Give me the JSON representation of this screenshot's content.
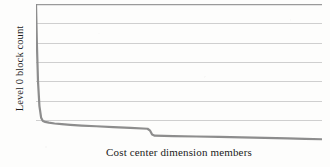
{
  "figure": {
    "background_color": "#fdfdfc",
    "plot_area": {
      "left": 36,
      "top": 4,
      "width": 286,
      "height": 138
    }
  },
  "chart_data": {
    "type": "line",
    "title": "",
    "subtitle": "",
    "xlabel": "Cost center dimension members",
    "ylabel": "Level 0 block count",
    "legend": [],
    "legend_position": "none",
    "grid": true,
    "grid_orientation": "horizontal",
    "grid_line_count": 7,
    "grid_color": "#c9c9c9",
    "top_border_color": "#9a9a9a",
    "line_color": "#8d8d8d",
    "line_width": 2.2,
    "xlim": [
      0,
      100
    ],
    "ylim": [
      0,
      100
    ],
    "x_tick_labels": [],
    "y_tick_labels": [],
    "x": [
      0.0,
      0.3,
      0.7,
      1.2,
      1.8,
      2.4,
      3.2,
      4.5,
      6.5,
      9.0,
      12.0,
      16.0,
      21.0,
      27.0,
      33.0,
      39.0,
      39.9,
      40.6,
      41.5,
      48.0,
      56.0,
      64.0,
      72.0,
      80.0,
      88.0,
      94.0,
      100.0
    ],
    "y": [
      100.0,
      72.0,
      44.0,
      26.0,
      17.5,
      15.2,
      14.6,
      14.0,
      13.4,
      12.9,
      12.4,
      11.9,
      11.4,
      10.8,
      10.2,
      9.6,
      8.2,
      5.4,
      4.6,
      4.3,
      4.0,
      3.7,
      3.4,
      3.0,
      2.6,
      2.3,
      2.0
    ],
    "gridlines_y": [
      100,
      86,
      72,
      58,
      44,
      30,
      16
    ]
  }
}
